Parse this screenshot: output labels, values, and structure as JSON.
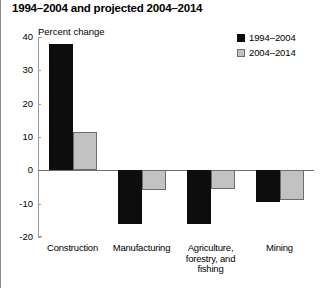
{
  "chart_data": {
    "type": "bar",
    "title": "1994–2004 and projected 2004–2014",
    "ylabel": "Percent change",
    "xlabel": "",
    "ylim": [
      -20,
      40
    ],
    "yticks": [
      40,
      30,
      20,
      10,
      0,
      -10,
      -20
    ],
    "ytick_labels": [
      "40",
      "30",
      "20",
      "10",
      "0",
      "-10",
      "-20"
    ],
    "grid": false,
    "legend_position": "top-right",
    "categories": [
      "Construction",
      "Manufacturing",
      "Agriculture,\nforestry, and\nfishing",
      "Mining"
    ],
    "series": [
      {
        "name": "1994–2004",
        "color": "#0d0d0d",
        "values": [
          38.0,
          -16.0,
          -16.0,
          -9.5
        ]
      },
      {
        "name": "2004–2014",
        "color": "#c2c2c2",
        "values": [
          11.5,
          -6.0,
          -5.5,
          -9.0
        ]
      }
    ]
  }
}
